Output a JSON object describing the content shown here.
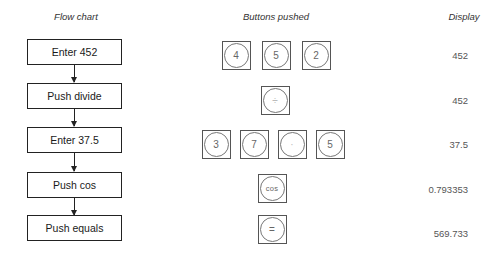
{
  "headers": {
    "flow_chart": "Flow chart",
    "buttons_pushed": "Buttons pushed",
    "display": "Display"
  },
  "steps": [
    {
      "label": "Enter 452",
      "buttons": [
        "4",
        "5",
        "2"
      ],
      "display": "452"
    },
    {
      "label": "Push divide",
      "buttons": [
        "÷"
      ],
      "display": "452"
    },
    {
      "label": "Enter 37.5",
      "buttons": [
        "3",
        "7",
        "·",
        "5"
      ],
      "display": "37.5"
    },
    {
      "label": "Push cos",
      "buttons": [
        "cos"
      ],
      "display": "0.793353"
    },
    {
      "label": "Push equals",
      "buttons": [
        "="
      ],
      "display": "569.733"
    }
  ],
  "colors": {
    "box_border": "#222222",
    "key_border": "#555555",
    "key_text": "#666666",
    "display_text": "#555555"
  }
}
